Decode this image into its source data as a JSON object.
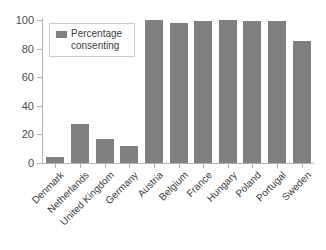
{
  "chart_data": {
    "type": "bar",
    "title": "",
    "xlabel": "",
    "ylabel": "",
    "categories": [
      "Denmark",
      "Netherlands",
      "United Kingdom",
      "Germany",
      "Austria",
      "Belgium",
      "France",
      "Hungary",
      "Poland",
      "Portugal",
      "Sweden"
    ],
    "values": [
      4,
      27,
      17,
      12,
      100,
      98,
      99,
      100,
      99,
      99,
      85.5
    ],
    "series": [
      {
        "name": "Percentage consenting",
        "values": [
          4,
          27,
          17,
          12,
          100,
          98,
          99,
          100,
          99,
          99,
          85.5
        ]
      }
    ],
    "ylim": [
      0,
      100
    ],
    "yticks": [
      0,
      20,
      40,
      60,
      80,
      100
    ],
    "ytick_labels": [
      "0",
      "20",
      "40",
      "60",
      "80",
      "100"
    ],
    "grid": false,
    "legend_position": "upper-left-inside",
    "bar_color": "#808080",
    "axis_color": "#b3b3b3",
    "background": "#ffffff"
  },
  "legend": {
    "label": "Percentage\nconsenting",
    "swatch_color": "#808080"
  }
}
